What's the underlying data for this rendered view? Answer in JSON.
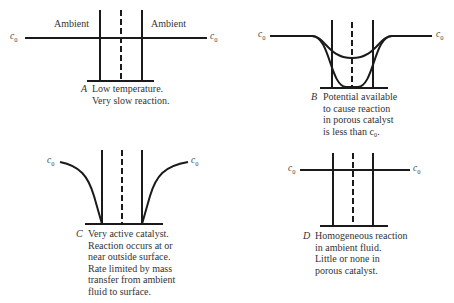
{
  "panels": {
    "A": {
      "letter": "A",
      "caption_lines": [
        "Low temperature.",
        "Very slow reaction."
      ],
      "region_labels": [
        "Ambient",
        "Ambient"
      ],
      "left_level": "c",
      "left_sub": "0",
      "right_level": "c",
      "right_sub": "0"
    },
    "B": {
      "letter": "B",
      "caption_lines": [
        "Potential available",
        "to cause reaction",
        "in porous catalyst",
        "is less than c₀."
      ],
      "left_level": "c",
      "left_sub": "0",
      "right_level": "c",
      "right_sub": "0"
    },
    "C": {
      "letter": "C",
      "caption_lines": [
        "Very active catalyst.",
        "Reaction occurs at or",
        "near outside surface.",
        "Rate limited by mass",
        "transfer from ambient",
        "fluid to surface."
      ],
      "left_level": "c",
      "left_sub": "0",
      "right_level": "c",
      "right_sub": "0"
    },
    "D": {
      "letter": "D",
      "caption_lines": [
        "Homogeneous reaction",
        "in ambient fluid.",
        "Little or none in",
        "porous catalyst."
      ],
      "left_level": "c",
      "left_sub": "0",
      "right_level": "c",
      "right_sub": "0"
    }
  },
  "colors": {
    "line": "#1a1a1a",
    "text": "#333333"
  }
}
